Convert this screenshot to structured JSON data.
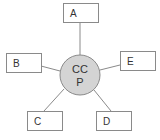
{
  "diagram": {
    "type": "hub-and-spoke",
    "hub": {
      "label_line1": "CC",
      "label_line2": "P",
      "fill": "#d4d4d4",
      "stroke": "#8a8a8a"
    },
    "nodes": [
      {
        "id": "A",
        "label": "A",
        "position": "top"
      },
      {
        "id": "B",
        "label": "B",
        "position": "left"
      },
      {
        "id": "E",
        "label": "E",
        "position": "right"
      },
      {
        "id": "C",
        "label": "C",
        "position": "bottom-left"
      },
      {
        "id": "D",
        "label": "D",
        "position": "bottom-right"
      }
    ],
    "edges": [
      {
        "from": "CCP",
        "to": "A"
      },
      {
        "from": "CCP",
        "to": "B"
      },
      {
        "from": "CCP",
        "to": "E"
      },
      {
        "from": "CCP",
        "to": "C"
      },
      {
        "from": "CCP",
        "to": "D"
      }
    ]
  }
}
